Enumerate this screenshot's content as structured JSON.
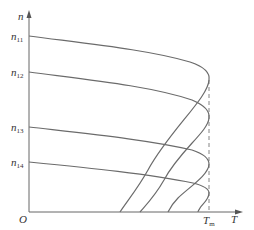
{
  "diagram": {
    "axes": {
      "y_label": "n",
      "x_label": "T",
      "origin_label": "O",
      "tm_label_main": "T",
      "tm_label_sub": "m"
    },
    "y_ticks": [
      {
        "main": "n",
        "sub": "11"
      },
      {
        "main": "n",
        "sub": "12"
      },
      {
        "main": "n",
        "sub": "13"
      },
      {
        "main": "n",
        "sub": "14"
      }
    ],
    "curves": [
      {
        "name": "curve-n11",
        "start_label": "n11"
      },
      {
        "name": "curve-n12",
        "start_label": "n12"
      },
      {
        "name": "curve-n13",
        "start_label": "n13"
      },
      {
        "name": "curve-n14",
        "start_label": "n14"
      }
    ],
    "colors": {
      "curve": "#6b6b6b",
      "axis": "#666666",
      "text": "#333333"
    }
  }
}
